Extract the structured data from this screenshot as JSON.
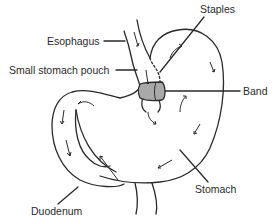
{
  "diagram": {
    "labels": {
      "staples": "Staples",
      "esophagus": "Esophagus",
      "pouch": "Small stomach pouch",
      "band": "Band",
      "stomach": "Stomach",
      "duodenum": "Duodenum"
    },
    "colors": {
      "line": "#2a2a2a",
      "band_fill": "#a9a9a9",
      "background": "#ffffff"
    }
  }
}
